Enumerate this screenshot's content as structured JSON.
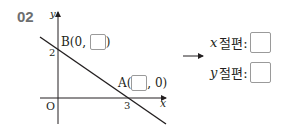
{
  "problem": {
    "number": "02",
    "graph": {
      "x_axis_label": "x",
      "y_axis_label": "y",
      "origin_label": "O",
      "y_intercept_tick": "2",
      "x_intercept_tick": "3",
      "point_b": {
        "prefix": "B(0, ",
        "suffix": ")"
      },
      "point_a": {
        "prefix": "A(",
        "suffix": ", 0)"
      }
    },
    "arrow": "⟶",
    "answers": [
      {
        "var": "x",
        "label": "절편:"
      },
      {
        "var": "y",
        "label": "절편:"
      }
    ]
  }
}
